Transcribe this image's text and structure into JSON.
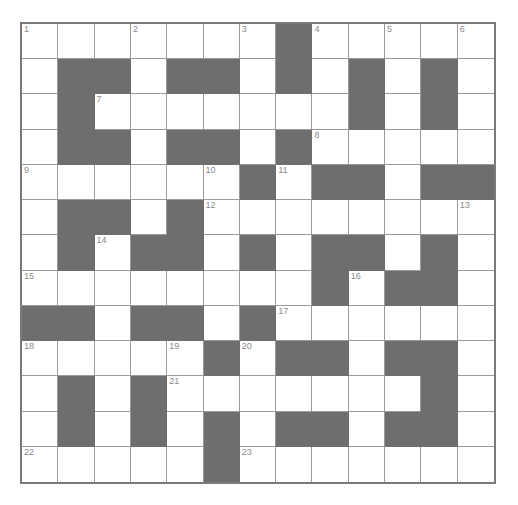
{
  "puzzle": {
    "rows": 13,
    "cols": 13,
    "colors": {
      "block": "#6e6e6e",
      "cell": "#ffffff",
      "number": "#8a8a8a",
      "border": "#7a7a7a"
    },
    "layout": [
      "WWWWWWWBWWWWW",
      "WBBWBBWBWBWBW",
      "WBWWWWWWWBWBW",
      "WBBWBBWBWWWWW",
      "WWWWWWBWBBWBB",
      "WBBWBWWWWWWWW",
      "WBWBBWBWBBWBW",
      "WWWWWWWWBWBBW",
      "BBWBBWBWWWWWW",
      "WWWWWBWBBWBBW",
      "WBWBWWWWWWWBW",
      "WBWBWBWBBWBBW",
      "WWWWWBWWWWWWW"
    ],
    "numbers": [
      {
        "n": "1",
        "r": 0,
        "c": 0
      },
      {
        "n": "2",
        "r": 0,
        "c": 3
      },
      {
        "n": "3",
        "r": 0,
        "c": 6
      },
      {
        "n": "4",
        "r": 0,
        "c": 8
      },
      {
        "n": "5",
        "r": 0,
        "c": 10
      },
      {
        "n": "6",
        "r": 0,
        "c": 12
      },
      {
        "n": "7",
        "r": 2,
        "c": 2
      },
      {
        "n": "8",
        "r": 3,
        "c": 8
      },
      {
        "n": "9",
        "r": 4,
        "c": 0
      },
      {
        "n": "10",
        "r": 4,
        "c": 5
      },
      {
        "n": "11",
        "r": 4,
        "c": 7
      },
      {
        "n": "12",
        "r": 5,
        "c": 5
      },
      {
        "n": "13",
        "r": 5,
        "c": 12
      },
      {
        "n": "14",
        "r": 6,
        "c": 2
      },
      {
        "n": "15",
        "r": 7,
        "c": 0
      },
      {
        "n": "16",
        "r": 7,
        "c": 9
      },
      {
        "n": "17",
        "r": 8,
        "c": 7
      },
      {
        "n": "18",
        "r": 9,
        "c": 0
      },
      {
        "n": "19",
        "r": 9,
        "c": 4
      },
      {
        "n": "20",
        "r": 9,
        "c": 6
      },
      {
        "n": "21",
        "r": 10,
        "c": 4
      },
      {
        "n": "22",
        "r": 12,
        "c": 0
      },
      {
        "n": "23",
        "r": 12,
        "c": 6
      }
    ]
  }
}
